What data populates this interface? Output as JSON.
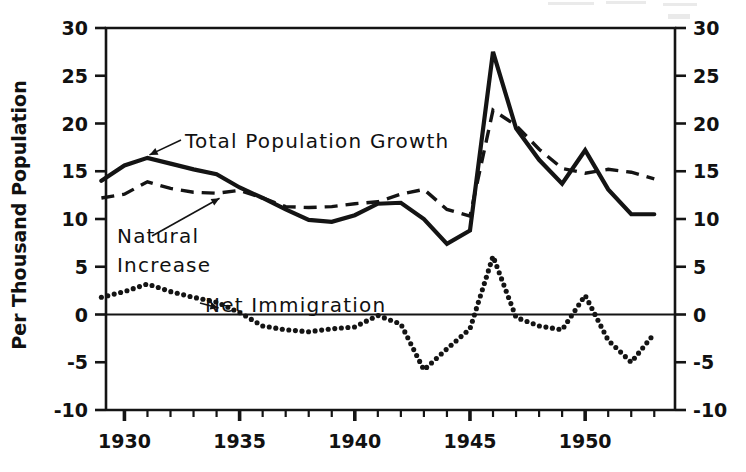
{
  "chart_data": {
    "type": "line",
    "title": "",
    "subtitle": "",
    "xlabel": "",
    "ylabel": "Per Thousand Population",
    "xlim": [
      1929.2,
      1953.9
    ],
    "ylim": [
      -10,
      30
    ],
    "grid": false,
    "legend_position": "inline-annotations",
    "y_ticks": [
      30,
      25,
      20,
      15,
      10,
      5,
      0,
      -5,
      -10
    ],
    "y_tick_labels": [
      "30",
      "25",
      "20",
      "15",
      "10",
      "5",
      "0",
      "-5",
      "-10"
    ],
    "y_axis_duplicated_right": true,
    "x_major_ticks": [
      1930,
      1935,
      1940,
      1945,
      1950
    ],
    "x_major_tick_labels": [
      "1930",
      "1935",
      "1940",
      "1945",
      "1950"
    ],
    "x_minor_tick_step": 1,
    "zero_line": true,
    "x": [
      1929,
      1930,
      1931,
      1932,
      1933,
      1934,
      1935,
      1936,
      1937,
      1938,
      1939,
      1940,
      1941,
      1942,
      1943,
      1944,
      1945,
      1946,
      1947,
      1948,
      1949,
      1950,
      1951,
      1952,
      1953
    ],
    "series": [
      {
        "name": "Total Population Growth",
        "style": "solid",
        "values": [
          14.0,
          15.6,
          16.4,
          15.8,
          15.2,
          14.7,
          13.3,
          12.2,
          11.0,
          9.9,
          9.7,
          10.4,
          11.6,
          11.7,
          10.0,
          7.4,
          8.8,
          27.5,
          19.5,
          16.2,
          13.7,
          17.2,
          13.1,
          10.5,
          10.5
        ]
      },
      {
        "name": "Natural Increase",
        "style": "dashed",
        "values": [
          12.2,
          12.6,
          13.9,
          13.2,
          12.8,
          12.7,
          13.0,
          12.2,
          11.3,
          11.2,
          11.3,
          11.6,
          11.8,
          12.6,
          13.1,
          11.0,
          10.3,
          21.4,
          19.8,
          17.3,
          15.3,
          14.8,
          15.2,
          14.9,
          14.2
        ]
      },
      {
        "name": "Net Immigration",
        "style": "dotted",
        "values": [
          1.8,
          2.4,
          3.2,
          2.4,
          1.8,
          1.3,
          0.2,
          -1.2,
          -1.6,
          -1.8,
          -1.5,
          -1.3,
          -0.1,
          -1.0,
          -5.8,
          -3.6,
          -1.5,
          6.1,
          -0.3,
          -1.2,
          -1.6,
          2.0,
          -2.7,
          -5.0,
          -2.0
        ]
      }
    ],
    "annotations": [
      {
        "text": "Total Population Growth",
        "target_year": 1931,
        "target_value": 16.4
      },
      {
        "text": "Natural Increase",
        "target_year": 1934,
        "target_value": 12.7
      },
      {
        "text": "Net Immigration",
        "target_year": 1934,
        "target_value": 1.3
      }
    ]
  },
  "labels": {
    "y_axis_title": "Per Thousand Population",
    "annotation_total": "Total Population Growth",
    "annotation_natural_1": "Natural",
    "annotation_natural_2": "Increase",
    "annotation_immigration": "Net Immigration"
  },
  "colors": {
    "ink": "#141414",
    "paper": "#ffffff"
  }
}
